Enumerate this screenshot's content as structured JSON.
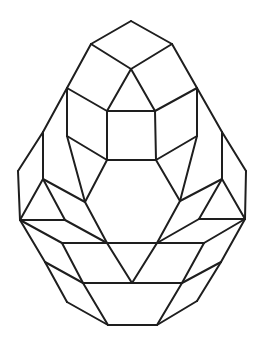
{
  "figure": {
    "stroke_color": "#1e1e1e",
    "background": "#ffffff"
  },
  "points": {
    "top": [
      131,
      21
    ],
    "tl": [
      91,
      44
    ],
    "tr": [
      172,
      44
    ],
    "c": [
      131,
      69
    ],
    "ol1": [
      67,
      88
    ],
    "or1": [
      197,
      88
    ],
    "sqtl": [
      107,
      111
    ],
    "sqtr": [
      155,
      111
    ],
    "ol2": [
      43,
      132
    ],
    "or2": [
      222,
      132
    ],
    "il": [
      67,
      136
    ],
    "ir": [
      197,
      136
    ],
    "sqbl": [
      107,
      160
    ],
    "sqbr": [
      156,
      160
    ],
    "el": [
      18,
      171
    ],
    "er": [
      246,
      171
    ],
    "ml": [
      43,
      179
    ],
    "mr": [
      222,
      179
    ],
    "hl": [
      85,
      202
    ],
    "hr": [
      180,
      201
    ],
    "fl": [
      20,
      220
    ],
    "fr": [
      245,
      219
    ],
    "nl": [
      65,
      220
    ],
    "nr": [
      199,
      219
    ],
    "hbl": [
      107,
      243
    ],
    "hbr": [
      157,
      243
    ],
    "pl": [
      62,
      243
    ],
    "pr": [
      204,
      243
    ],
    "ql": [
      45,
      262
    ],
    "qr": [
      221,
      262
    ],
    "rl": [
      83,
      283
    ],
    "rr": [
      182,
      283
    ],
    "vm": [
      132,
      283
    ],
    "sl": [
      67,
      302
    ],
    "sr": [
      197,
      301
    ],
    "bl": [
      108,
      325
    ],
    "br": [
      157,
      325
    ]
  },
  "edges": [
    [
      "top",
      "tl"
    ],
    [
      "top",
      "tr"
    ],
    [
      "tl",
      "c"
    ],
    [
      "tr",
      "c"
    ],
    [
      "tl",
      "ol1"
    ],
    [
      "tr",
      "or1"
    ],
    [
      "c",
      "sqtl"
    ],
    [
      "c",
      "sqtr"
    ],
    [
      "ol1",
      "sqtl"
    ],
    [
      "or1",
      "sqtr"
    ],
    [
      "sqtl",
      "sqtr"
    ],
    [
      "sqtl",
      "sqbl"
    ],
    [
      "sqtr",
      "sqbr"
    ],
    [
      "sqbl",
      "sqbr"
    ],
    [
      "ol1",
      "il"
    ],
    [
      "or1",
      "ir"
    ],
    [
      "il",
      "sqbl"
    ],
    [
      "ir",
      "sqbr"
    ],
    [
      "ol1",
      "ol2"
    ],
    [
      "or1",
      "or2"
    ],
    [
      "ol2",
      "el"
    ],
    [
      "or2",
      "er"
    ],
    [
      "ol2",
      "ml"
    ],
    [
      "or2",
      "mr"
    ],
    [
      "il",
      "hl"
    ],
    [
      "ir",
      "hr"
    ],
    [
      "sqbl",
      "hl"
    ],
    [
      "sqbr",
      "hr"
    ],
    [
      "hl",
      "hbl"
    ],
    [
      "hr",
      "hbr"
    ],
    [
      "hbl",
      "hbr"
    ],
    [
      "el",
      "fl"
    ],
    [
      "er",
      "fr"
    ],
    [
      "ml",
      "fl"
    ],
    [
      "mr",
      "fr"
    ],
    [
      "ml",
      "nl"
    ],
    [
      "mr",
      "nr"
    ],
    [
      "ml",
      "hl"
    ],
    [
      "mr",
      "hr"
    ],
    [
      "fl",
      "nl"
    ],
    [
      "fr",
      "nr"
    ],
    [
      "nl",
      "hbl"
    ],
    [
      "nr",
      "hbr"
    ],
    [
      "fl",
      "pl"
    ],
    [
      "fr",
      "pr"
    ],
    [
      "pl",
      "hbl"
    ],
    [
      "pr",
      "hbr"
    ],
    [
      "hbl",
      "pr"
    ],
    [
      "fl",
      "ql"
    ],
    [
      "fr",
      "qr"
    ],
    [
      "pl",
      "rl"
    ],
    [
      "pr",
      "rr"
    ],
    [
      "hbl",
      "vm"
    ],
    [
      "hbr",
      "vm"
    ],
    [
      "ql",
      "rl"
    ],
    [
      "qr",
      "rr"
    ],
    [
      "ql",
      "sl"
    ],
    [
      "qr",
      "sr"
    ],
    [
      "rl",
      "rr"
    ],
    [
      "sl",
      "bl"
    ],
    [
      "sr",
      "br"
    ],
    [
      "rl",
      "bl"
    ],
    [
      "rr",
      "br"
    ],
    [
      "bl",
      "br"
    ]
  ]
}
